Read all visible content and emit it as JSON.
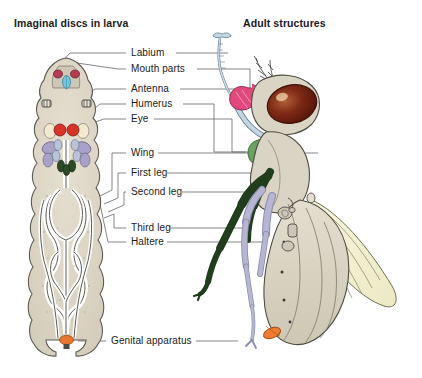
{
  "figure": {
    "panels": {
      "left_title": "Imaginal discs in larva",
      "right_title": "Adult structures"
    },
    "labels": [
      {
        "id": "labium",
        "text": "Labium"
      },
      {
        "id": "mouth-parts",
        "text": "Mouth parts"
      },
      {
        "id": "antenna",
        "text": "Antenna"
      },
      {
        "id": "humerus",
        "text": "Humerus"
      },
      {
        "id": "eye",
        "text": "Eye"
      },
      {
        "id": "wing",
        "text": "Wing"
      },
      {
        "id": "first-leg",
        "text": "First leg"
      },
      {
        "id": "second-leg",
        "text": "Second leg"
      },
      {
        "id": "third-leg",
        "text": "Third leg"
      },
      {
        "id": "haltere",
        "text": "Haltere"
      },
      {
        "id": "genital-apparatus",
        "text": "Genital apparatus"
      }
    ],
    "colors": {
      "background": "#ffffff",
      "text": "#1a1a1a",
      "leader_line": "#6d6f72",
      "larva_body": "#ded8c8",
      "larva_outline": "#5b5b52",
      "larva_gut": "#ffffff",
      "disc_labium": "#b83a52",
      "disc_mouth_parts": "#6fc5e2",
      "disc_antenna": "#4a4a4a",
      "disc_humerus": "#f2ead0",
      "disc_eye": "#d8342a",
      "disc_wing": "#a9a2c8",
      "disc_leg": "#b9c4d8",
      "disc_haltere": "#2b4a28",
      "disc_genital": "#e8762c",
      "adult_body": "#d9d4c3",
      "adult_eye": "#6b1f14",
      "adult_eye_highlight": "#e8c9a0",
      "adult_mouth_parts": "#e0487e",
      "adult_labium": "#c3d6e4",
      "adult_humerus": "#6aa35e",
      "adult_leg_third": "#203d1c",
      "adult_leg_pale": "#b6b6d4",
      "adult_wing": "#f2f0cf",
      "adult_genital": "#ee7b2e"
    }
  }
}
